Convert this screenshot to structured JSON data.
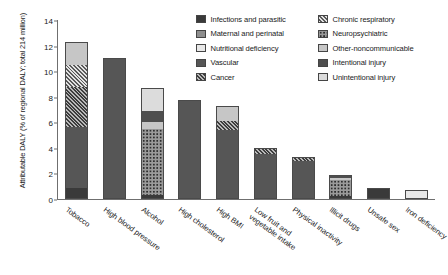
{
  "chart_data": {
    "type": "bar",
    "subtype": "stacked-bar",
    "title": "",
    "xlabel": "",
    "ylabel": "Attributable DALY (% of regional DALY; total 214 million)",
    "ylim": [
      0,
      14
    ],
    "yticks": [
      0,
      2,
      4,
      6,
      8,
      10,
      12,
      14
    ],
    "grid": false,
    "legend_position": "top-right",
    "categories": [
      "Tobacco",
      "High blood pressure",
      "Alcohol",
      "High cholesterol",
      "High BMI",
      "Low fruit and vegetable intake",
      "Physical inactivity",
      "Illicit drugs",
      "Unsafe sex",
      "Iron deficiency"
    ],
    "series": [
      {
        "name": "Infections and parasitic",
        "key": "infections",
        "values": [
          0.9,
          0,
          0.35,
          0,
          0,
          0,
          0,
          0.25,
          0.85,
          0
        ]
      },
      {
        "name": "Maternal and perinatal",
        "key": "maternal",
        "values": [
          0,
          0,
          0,
          0,
          0,
          0,
          0,
          0,
          0,
          0
        ]
      },
      {
        "name": "Nutritional deficiency",
        "key": "nutrition",
        "values": [
          0,
          0,
          0,
          0,
          0,
          0,
          0,
          0,
          0,
          0.7
        ]
      },
      {
        "name": "Vascular",
        "key": "vascular",
        "values": [
          4.7,
          11.0,
          0,
          7.75,
          5.4,
          3.5,
          3.0,
          0,
          0,
          0
        ]
      },
      {
        "name": "Cancer",
        "key": "cancer",
        "values": [
          3.2,
          0,
          0,
          0,
          0.7,
          0.5,
          0.3,
          0,
          0,
          0
        ]
      },
      {
        "name": "Chronic respiratory",
        "key": "chronic",
        "values": [
          1.7,
          0,
          0,
          0,
          0,
          0,
          0,
          0,
          0,
          0
        ]
      },
      {
        "name": "Neuropsychiatric",
        "key": "neuro",
        "values": [
          0,
          0,
          5.1,
          0,
          0,
          0,
          0,
          1.25,
          0,
          0
        ]
      },
      {
        "name": "Other-noncommunicable",
        "key": "othernon",
        "values": [
          1.8,
          0,
          0.55,
          0,
          1.2,
          0,
          0,
          0.15,
          0,
          0
        ]
      },
      {
        "name": "Intentional injury",
        "key": "intentional",
        "values": [
          0,
          0,
          0.85,
          0,
          0,
          0,
          0,
          0.25,
          0,
          0
        ]
      },
      {
        "name": "Unintentional injury",
        "key": "unintentional",
        "values": [
          0,
          0,
          1.8,
          0,
          0,
          0,
          0,
          0,
          0,
          0
        ]
      }
    ],
    "totals": [
      12.3,
      11.0,
      8.65,
      7.75,
      7.3,
      4.0,
      3.3,
      1.9,
      0.85,
      0.7
    ]
  },
  "legend": {
    "items": [
      {
        "label": "Infections and parasitic",
        "key": "infections"
      },
      {
        "label": "Chronic respiratory",
        "key": "chronic"
      },
      {
        "label": "Maternal and perinatal",
        "key": "maternal"
      },
      {
        "label": "Neuropsychiatric",
        "key": "neuro"
      },
      {
        "label": "Nutritional deficiency",
        "key": "nutrition"
      },
      {
        "label": "Other-noncommunicable",
        "key": "othernon"
      },
      {
        "label": "Vascular",
        "key": "vascular"
      },
      {
        "label": "Intentional injury",
        "key": "intentional"
      },
      {
        "label": "Cancer",
        "key": "cancer"
      },
      {
        "label": "Unintentional injury",
        "key": "unintentional"
      }
    ]
  },
  "colors": {
    "infections": "#3a3a3a",
    "maternal": "#8e8e8e",
    "nutrition": "#e8e8e8",
    "vascular": "#565656",
    "cancer": "#3d3d3d",
    "chronic": "#e2e2e2",
    "neuro": "#9a9a9a",
    "othernon": "#c6c6c6",
    "intentional": "#4e4e4e",
    "unintentional": "#dcdcdc",
    "axis": "#6f6f6f",
    "text": "#1a1a1a"
  }
}
